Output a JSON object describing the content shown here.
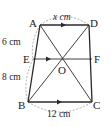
{
  "figure": {
    "type": "trapezoid",
    "points": {
      "A": {
        "label": "A",
        "x": 40,
        "y": 25
      },
      "D": {
        "label": "D",
        "x": 89,
        "y": 25
      },
      "E": {
        "label": "E",
        "x": 33,
        "y": 59
      },
      "F": {
        "label": "F",
        "x": 92,
        "y": 59
      },
      "O": {
        "label": "O",
        "x": 62,
        "y": 59
      },
      "B": {
        "label": "B",
        "x": 28,
        "y": 102
      },
      "C": {
        "label": "C",
        "x": 92,
        "y": 102
      }
    },
    "measurements": {
      "AD": "x cm",
      "AE": "6 cm",
      "EB": "8 cm",
      "BC": "12 cm"
    },
    "parallel_marks": [
      "AD",
      "EF",
      "BC"
    ],
    "colors": {
      "line": "#2a2a2a",
      "dashed_arc": "#9a9a9a",
      "text": "#222222",
      "background": "#ffffff"
    }
  }
}
